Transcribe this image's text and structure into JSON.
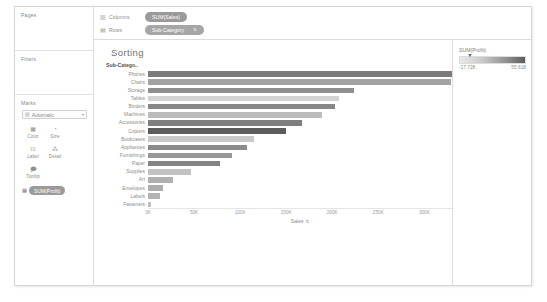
{
  "shelves": {
    "pages": {
      "label": "Pages"
    },
    "filters": {
      "label": "Filters"
    },
    "marks": {
      "label": "Marks",
      "type_icon": "bar-chart-icon",
      "type_label": "Automatic",
      "caret": "▾",
      "buttons": [
        {
          "name": "color",
          "label": "Color",
          "glyph": "▦"
        },
        {
          "name": "size",
          "label": "Size",
          "glyph": "◔"
        },
        {
          "name": "label",
          "label": "Label",
          "glyph": "⊡"
        },
        {
          "name": "detail",
          "label": "Detail",
          "glyph": "⁂"
        },
        {
          "name": "tooltip",
          "label": "Tooltip",
          "glyph": "🗩"
        }
      ],
      "encoding_pills": [
        {
          "glyph": "▦",
          "label": "SUM(Profit)",
          "color_class": "green"
        }
      ]
    },
    "columns": {
      "icon": "columns-icon",
      "glyph": "▥",
      "label": "Columns",
      "pill": "SUM(Sales)",
      "pill_color": "green"
    },
    "rows": {
      "icon": "rows-icon",
      "glyph": "▤",
      "label": "Rows",
      "pill": "Sub-Category",
      "pill_color": "blue",
      "sort_icon": "⇅"
    }
  },
  "worksheet": {
    "title": "Sorting",
    "row_header_title": "Sub-Catego..",
    "x_axis_label": "Sales",
    "x_axis_sort_icon": "⇅"
  },
  "legend": {
    "title": "SUM(Profit)",
    "min": "-17,728",
    "max": "55,618"
  },
  "chart_data": {
    "type": "bar",
    "orientation": "horizontal",
    "title": "Sorting",
    "xlabel": "Sales",
    "ylabel": "Sub-Category",
    "xlim": [
      0,
      330000
    ],
    "xticks": [
      0,
      50000,
      100000,
      150000,
      200000,
      250000,
      300000
    ],
    "xticklabels": [
      "0K",
      "50K",
      "100K",
      "150K",
      "200K",
      "250K",
      "300K"
    ],
    "grid": false,
    "legend": {
      "title": "SUM(Profit)",
      "position": "right",
      "type": "sequential-color",
      "min": -17728,
      "max": 55618
    },
    "color_encoding": "SUM(Profit)",
    "categories": [
      "Phones",
      "Chairs",
      "Storage",
      "Tables",
      "Binders",
      "Machines",
      "Accessories",
      "Copiers",
      "Bookcases",
      "Appliances",
      "Furnishings",
      "Paper",
      "Supplies",
      "Art",
      "Envelopes",
      "Labels",
      "Fasteners"
    ],
    "values": [
      330007,
      328449,
      223844,
      206966,
      203413,
      189239,
      167380,
      149528,
      114880,
      107532,
      91705,
      78479,
      46674,
      27119,
      16476,
      12486,
      3024
    ],
    "color_values": [
      44516,
      -6654,
      21279,
      -17725,
      30222,
      3385,
      41937,
      55618,
      -3473,
      18138,
      13059,
      34053,
      -1189,
      6528,
      6964,
      5546,
      949
    ],
    "series": [
      {
        "name": "SUM(Sales)",
        "values": [
          330007,
          328449,
          223844,
          206966,
          203413,
          189239,
          167380,
          149528,
          114880,
          107532,
          91705,
          78479,
          46674,
          27119,
          16476,
          12486,
          3024
        ]
      }
    ],
    "bar_colors": [
      "#7b7b7b",
      "#a3a3a3",
      "#8f8f8f",
      "#d4d4d4",
      "#878787",
      "#bcbcbc",
      "#7e7e7e",
      "#5c5c5c",
      "#c9c9c9",
      "#8b8b8b",
      "#989898",
      "#838383",
      "#c2c2c2",
      "#b0b0b0",
      "#aeaeae",
      "#b3b3b3",
      "#bfbfbf"
    ]
  }
}
